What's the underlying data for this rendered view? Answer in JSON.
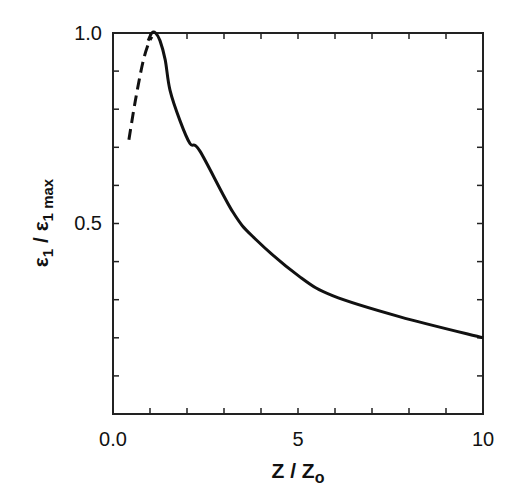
{
  "chart_data": {
    "type": "line",
    "title": "",
    "xlabel": "z / z_o",
    "ylabel": "ε1 / ε1 max",
    "xlim": [
      0,
      10
    ],
    "ylim": [
      0,
      1.0
    ],
    "grid": false,
    "legend": null,
    "x_ticks": [
      0,
      1,
      2,
      3,
      4,
      5,
      6,
      7,
      8,
      9,
      10
    ],
    "x_tick_labels": [
      {
        "value": 0,
        "label": "0.0"
      },
      {
        "value": 5,
        "label": "5"
      },
      {
        "value": 10,
        "label": "10"
      }
    ],
    "y_ticks": [
      0.1,
      0.2,
      0.3,
      0.4,
      0.5,
      0.6,
      0.7,
      0.8,
      0.9,
      1.0
    ],
    "y_tick_labels": [
      {
        "value": 0.5,
        "label": "0.5"
      },
      {
        "value": 1.0,
        "label": "1.0"
      }
    ],
    "series": [
      {
        "name": "extrapolated (dashed)",
        "style": "dashed",
        "x": [
          0.43,
          0.6,
          0.8,
          0.95,
          1.05
        ],
        "y": [
          0.72,
          0.82,
          0.92,
          0.97,
          0.99
        ]
      },
      {
        "name": "measured (solid)",
        "style": "solid",
        "x": [
          0.95,
          1.05,
          1.15,
          1.27,
          1.41,
          1.54,
          1.81,
          2.08,
          2.35,
          3.24,
          3.84,
          5.05,
          5.95,
          7.76,
          10.0
        ],
        "y": [
          0.98,
          1.0,
          1.0,
          0.98,
          0.93,
          0.85,
          0.77,
          0.71,
          0.69,
          0.53,
          0.46,
          0.36,
          0.31,
          0.255,
          0.2
        ]
      }
    ]
  },
  "labels": {
    "y_main": "ε",
    "y_sub1": "1",
    "y_slash": " / ε",
    "y_sub2": "1 max",
    "x_main": "Z / Z",
    "x_sub": "o",
    "x0": "0.0",
    "x5": "5",
    "x10": "10",
    "y05": "0.5",
    "y10": "1.0"
  }
}
